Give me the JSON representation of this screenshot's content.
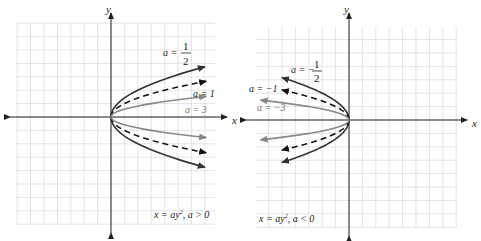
{
  "figure": {
    "panels": [
      {
        "id": "positive",
        "axis_labels": {
          "x": "x",
          "y": "y"
        },
        "equation": {
          "main": "x = ay",
          "exp": "2",
          "cond": ", a > 0"
        },
        "curves": [
          {
            "a": 0.5,
            "label_prefix": "a =",
            "label_num": "1",
            "label_den": "2",
            "style": "solid",
            "color": "#333333"
          },
          {
            "a": 1,
            "label": "a = 1",
            "style": "dashed",
            "color": "#111111"
          },
          {
            "a": 3,
            "label": "a = 3",
            "style": "solid",
            "color": "#888888"
          }
        ]
      },
      {
        "id": "negative",
        "axis_labels": {
          "x": "x",
          "y": "y"
        },
        "equation": {
          "main": "x = ay",
          "exp": "2",
          "cond": ", a < 0"
        },
        "curves": [
          {
            "a": -0.5,
            "label_prefix": "a = −",
            "label_num": "1",
            "label_den": "2",
            "style": "solid",
            "color": "#333333"
          },
          {
            "a": -1,
            "label": "a = −1",
            "style": "dashed",
            "color": "#111111"
          },
          {
            "a": -3,
            "label": "a = −3",
            "style": "solid",
            "color": "#888888"
          }
        ]
      }
    ]
  }
}
